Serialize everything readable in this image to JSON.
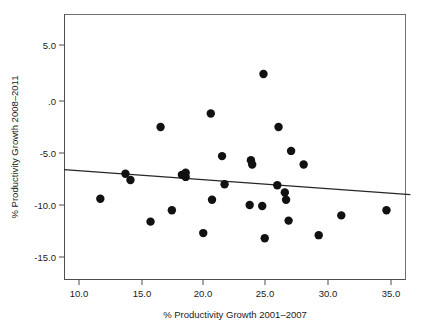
{
  "chart_data": {
    "type": "scatter",
    "title": "",
    "xlabel": "% Productivity Growth 2001–2007",
    "ylabel": "% Productivity Growth 2008–2011",
    "xlim": [
      8.8,
      36.4
    ],
    "ylim": [
      -16.2,
      6.7
    ],
    "xticks": [
      10.0,
      15.0,
      20.0,
      25.0,
      30.0,
      35.0
    ],
    "xtick_labels": [
      "10.0",
      "15.0",
      "20.0",
      "25.0",
      "30.0",
      "35.0"
    ],
    "yticks": [
      5.0,
      0.0,
      -5.0,
      -10.0,
      -15.0
    ],
    "ytick_labels": [
      "5.0",
      ".0",
      "-5.0",
      "-10.0",
      "-15.0"
    ],
    "grid": false,
    "legend": null,
    "marker": {
      "shape": "circle",
      "color": "#111111",
      "size": 4.2
    },
    "points": [
      {
        "x": 11.7,
        "y": -9.4
      },
      {
        "x": 13.7,
        "y": -7.0
      },
      {
        "x": 14.1,
        "y": -7.6
      },
      {
        "x": 15.7,
        "y": -11.6
      },
      {
        "x": 16.5,
        "y": -2.5
      },
      {
        "x": 17.4,
        "y": -10.5
      },
      {
        "x": 18.2,
        "y": -7.1
      },
      {
        "x": 18.5,
        "y": -6.9
      },
      {
        "x": 18.5,
        "y": -7.3
      },
      {
        "x": 19.9,
        "y": -12.7
      },
      {
        "x": 20.5,
        "y": -1.2
      },
      {
        "x": 20.6,
        "y": -9.5
      },
      {
        "x": 21.4,
        "y": -5.3
      },
      {
        "x": 21.6,
        "y": -8.0
      },
      {
        "x": 23.6,
        "y": -10.0
      },
      {
        "x": 23.7,
        "y": -5.7
      },
      {
        "x": 23.8,
        "y": -6.1
      },
      {
        "x": 24.6,
        "y": -10.1
      },
      {
        "x": 24.7,
        "y": 2.6
      },
      {
        "x": 24.8,
        "y": -13.2
      },
      {
        "x": 25.8,
        "y": -8.1
      },
      {
        "x": 25.9,
        "y": -2.5
      },
      {
        "x": 26.4,
        "y": -8.8
      },
      {
        "x": 26.5,
        "y": -9.5
      },
      {
        "x": 26.7,
        "y": -11.5
      },
      {
        "x": 26.9,
        "y": -4.8
      },
      {
        "x": 27.9,
        "y": -6.1
      },
      {
        "x": 29.1,
        "y": -12.9
      },
      {
        "x": 30.9,
        "y": -11.0
      },
      {
        "x": 34.5,
        "y": -10.5
      }
    ],
    "fit_line": {
      "type": "linear",
      "x_start": 8.8,
      "y_start": -6.6,
      "x_end": 36.4,
      "y_end": -9.0
    }
  }
}
